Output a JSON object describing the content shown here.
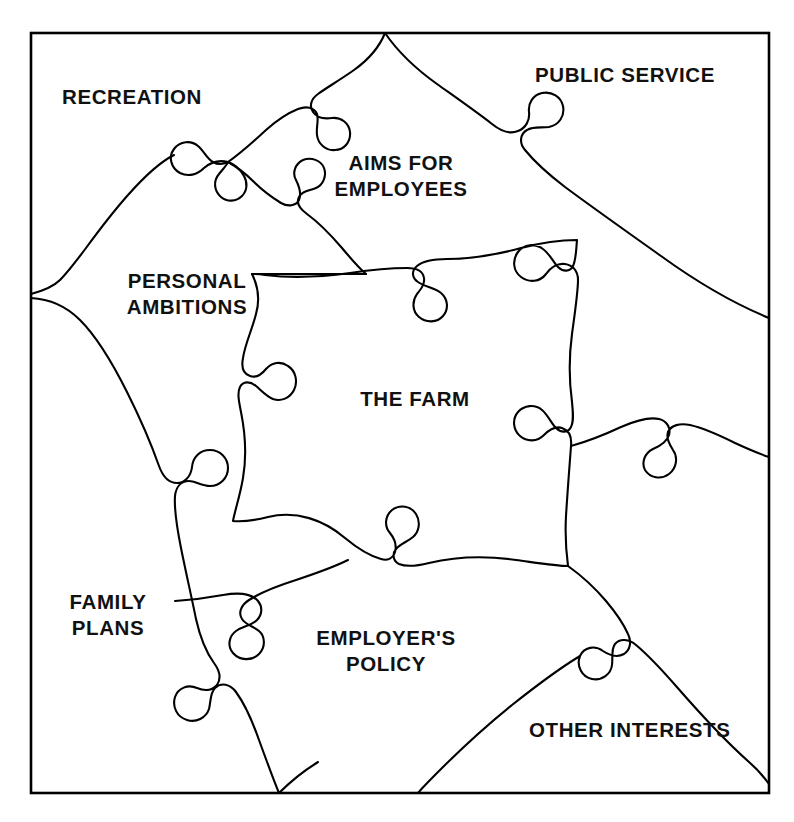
{
  "diagram": {
    "type": "jigsaw-puzzle-diagram",
    "title": "THE FARM",
    "frame": {
      "border_color": "#000000",
      "background_color": "#ffffff"
    },
    "line_color": "#000000",
    "center_piece": {
      "label": "THE FARM"
    },
    "pieces": [
      {
        "id": "recreation",
        "label": "RECREATION",
        "position": "top-left"
      },
      {
        "id": "public-service",
        "label": "PUBLIC SERVICE",
        "position": "top-right"
      },
      {
        "id": "aims-for-employees",
        "label": "AIMS FOR\nEMPLOYEES",
        "position": "top-center"
      },
      {
        "id": "personal-ambitions",
        "label": "PERSONAL\nAMBITIONS",
        "position": "left-upper"
      },
      {
        "id": "family-plans",
        "label": "FAMILY\nPLANS",
        "position": "left-lower"
      },
      {
        "id": "employers-policy",
        "label": "EMPLOYER'S\nPOLICY",
        "position": "bottom-center"
      },
      {
        "id": "other-interests",
        "label": "OTHER INTERESTS",
        "position": "bottom-right"
      }
    ]
  }
}
